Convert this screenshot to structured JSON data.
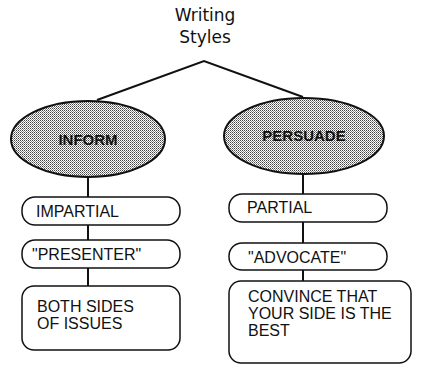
{
  "title": {
    "line1": "Writing",
    "line2": "Styles"
  },
  "branches": [
    {
      "label": "INFORM",
      "items": [
        "IMPARTIAL",
        "\"PRESENTER\""
      ],
      "description": [
        "BOTH SIDES",
        "OF ISSUES"
      ]
    },
    {
      "label": "PERSUADE",
      "items": [
        "PARTIAL",
        "\"ADVOCATE\""
      ],
      "description": [
        "CONVINCE THAT",
        "YOUR SIDE IS THE",
        "BEST"
      ]
    }
  ],
  "colors": {
    "stroke": "#111111",
    "ellipse_fill": "#c8c8c8",
    "background": "#ffffff"
  }
}
